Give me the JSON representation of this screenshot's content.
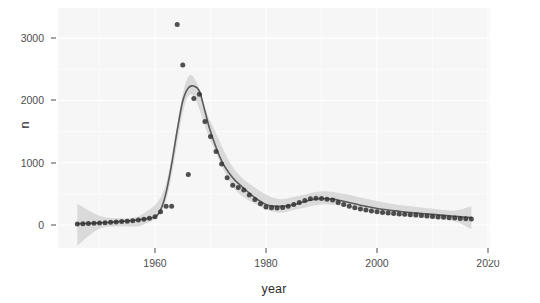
{
  "chart_data": {
    "type": "line",
    "title": "",
    "subtitle": "",
    "xlabel": "year",
    "ylabel": "n",
    "xlim": [
      1946,
      2019
    ],
    "ylim": [
      -390,
      3340
    ],
    "grid": true,
    "legend": null,
    "x_ticks": [
      1960,
      1980,
      2000,
      2020
    ],
    "x_tick_labels": [
      "1960",
      "1980",
      "2000",
      "2020"
    ],
    "y_ticks": [
      0,
      1000,
      2000,
      3000
    ],
    "y_tick_labels": [
      "0",
      "1000",
      "2000",
      "3000"
    ],
    "panel_background": "#f6f6f6",
    "gridline_color": "#ffffff",
    "point_color": "#333333",
    "line_color": "#5a5a5a",
    "ribbon_color": "#cfcfcf",
    "series": [
      {
        "name": "observed",
        "type": "scatter",
        "x": [
          1946,
          1947,
          1948,
          1949,
          1950,
          1951,
          1952,
          1953,
          1954,
          1955,
          1956,
          1957,
          1958,
          1959,
          1960,
          1961,
          1962,
          1963,
          1964,
          1965,
          1966,
          1967,
          1968,
          1969,
          1970,
          1971,
          1972,
          1973,
          1974,
          1975,
          1976,
          1977,
          1978,
          1979,
          1980,
          1981,
          1982,
          1983,
          1984,
          1985,
          1986,
          1987,
          1988,
          1989,
          1990,
          1991,
          1992,
          1993,
          1994,
          1995,
          1996,
          1997,
          1998,
          1999,
          2000,
          2001,
          2002,
          2003,
          2004,
          2005,
          2006,
          2007,
          2008,
          2009,
          2010,
          2011,
          2012,
          2013,
          2014,
          2015,
          2016,
          2017
        ],
        "y": [
          18,
          22,
          26,
          30,
          34,
          38,
          44,
          50,
          56,
          62,
          70,
          80,
          92,
          108,
          132,
          212,
          300,
          300,
          3220,
          2570,
          810,
          2030,
          2100,
          1660,
          1420,
          1180,
          980,
          760,
          640,
          600,
          560,
          480,
          410,
          340,
          290,
          278,
          272,
          280,
          300,
          330,
          360,
          395,
          420,
          430,
          425,
          415,
          400,
          360,
          330,
          300,
          275,
          255,
          240,
          225,
          212,
          200,
          192,
          185,
          178,
          172,
          166,
          160,
          152,
          145,
          138,
          130,
          124,
          118,
          112,
          106,
          100,
          96
        ]
      },
      {
        "name": "loess fit",
        "type": "line",
        "x": [
          1946,
          1948,
          1950,
          1952,
          1954,
          1956,
          1958,
          1960,
          1961,
          1962,
          1963,
          1964,
          1965,
          1966,
          1967,
          1968,
          1969,
          1970,
          1972,
          1974,
          1976,
          1978,
          1980,
          1982,
          1984,
          1986,
          1988,
          1990,
          1992,
          1994,
          1996,
          1998,
          2000,
          2002,
          2004,
          2006,
          2008,
          2010,
          2012,
          2014,
          2016,
          2017
        ],
        "y": [
          20,
          26,
          34,
          44,
          58,
          74,
          96,
          130,
          240,
          520,
          980,
          1520,
          1990,
          2200,
          2230,
          2150,
          1830,
          1500,
          1030,
          760,
          590,
          440,
          330,
          300,
          310,
          350,
          400,
          425,
          415,
          380,
          340,
          300,
          265,
          240,
          220,
          200,
          185,
          170,
          155,
          140,
          125,
          118
        ]
      },
      {
        "name": "confidence band",
        "type": "area",
        "x": [
          1946,
          1950,
          1954,
          1958,
          1962,
          1966,
          1970,
          1974,
          1978,
          1982,
          1986,
          1990,
          1994,
          1998,
          2002,
          2006,
          2010,
          2014,
          2017
        ],
        "ymin": [
          -330,
          -60,
          -20,
          10,
          390,
          2070,
          1350,
          620,
          340,
          200,
          260,
          330,
          300,
          215,
          165,
          130,
          100,
          60,
          -70
        ],
        "ymax": [
          340,
          150,
          110,
          190,
          660,
          2380,
          1660,
          930,
          600,
          420,
          470,
          540,
          500,
          420,
          350,
          300,
          260,
          230,
          300
        ]
      }
    ],
    "annotations": [
      {
        "label": "outlier high",
        "x": 1964,
        "y": 3220
      },
      {
        "label": "outlier second",
        "x": 1965,
        "y": 2570
      },
      {
        "label": "outlier low 1966",
        "x": 1966,
        "y": 810
      }
    ]
  }
}
